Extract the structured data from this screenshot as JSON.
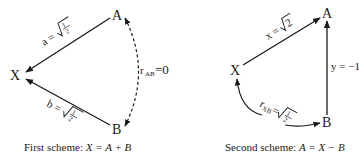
{
  "scheme1": {
    "nodes": {
      "A": "A",
      "B": "B",
      "X": "X"
    },
    "edge_AX_label": "a = √(1/2)",
    "edge_BX_label": "b = √(1/2)",
    "correlation_label": "r_AB = 0",
    "caption_prefix": "First scheme: ",
    "caption_math": "X = A + B"
  },
  "scheme2": {
    "nodes": {
      "A": "A",
      "B": "B",
      "X": "X"
    },
    "edge_XA_label": "x = √2",
    "edge_BA_label": "y = −1",
    "correlation_label": "r_XB = √(1/2)",
    "caption_prefix": "Second scheme: ",
    "caption_math": "A = X − B"
  },
  "colors": {
    "ink": "#1a1a1a",
    "background": "#ffffff"
  }
}
